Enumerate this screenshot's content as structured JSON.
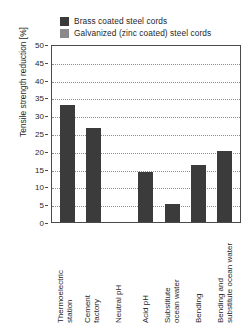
{
  "chart_data": {
    "type": "bar",
    "title": "",
    "xlabel": "",
    "ylabel": "Tensile strength reduction [%]",
    "ylim": [
      0,
      50
    ],
    "ytick_step": 5,
    "yticks": [
      "50",
      "45",
      "40",
      "35",
      "30",
      "25",
      "20",
      "15",
      "10",
      "5",
      "0"
    ],
    "grid": "horizontal-dotted",
    "legend_position": "top",
    "categories": [
      "Thermoelectric station",
      "Cement factory",
      "Neutral pH",
      "Acid pH",
      "Substitute ocean water",
      "Bending",
      "Bending and substitute ocean water"
    ],
    "category_lines": [
      [
        "Thermoelectric",
        "station"
      ],
      [
        "Cement",
        "factory"
      ],
      [
        "Neutral pH"
      ],
      [
        "Acid pH"
      ],
      [
        "Substitute",
        "ocean water"
      ],
      [
        "Bending"
      ],
      [
        "Bending and",
        "substitute ocean water"
      ]
    ],
    "series": [
      {
        "name": "Brass coated steel cords",
        "color": "#3b3b3b",
        "values": [
          33,
          26.5,
          0,
          14,
          5,
          16,
          20
        ]
      },
      {
        "name": "Galvanized (zinc coated) steel cords",
        "color": "#8a8a8a",
        "values": [
          0,
          0,
          0,
          0,
          0,
          0,
          0
        ]
      }
    ]
  },
  "legend": {
    "items": [
      {
        "label": "Brass coated steel cords",
        "color": "#3b3b3b"
      },
      {
        "label": "Galvanized (zinc coated) steel cords",
        "color": "#8a8a8a"
      }
    ]
  }
}
